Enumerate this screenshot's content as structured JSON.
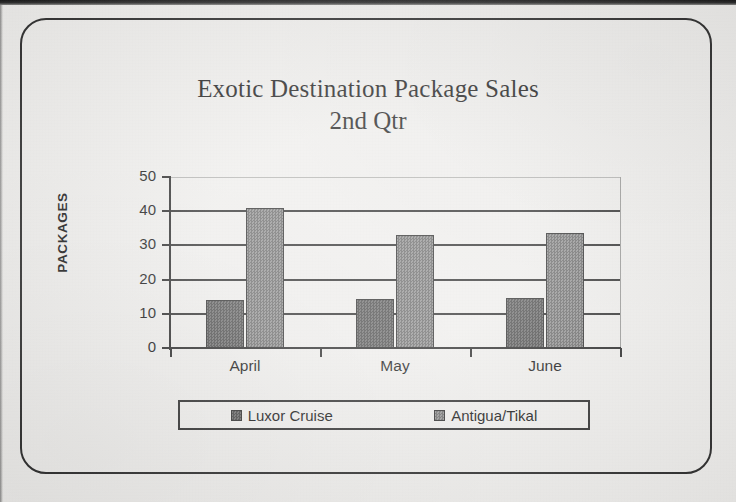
{
  "chart_data": {
    "type": "bar",
    "title": "Exotic Destination Package Sales",
    "subtitle": "2nd Qtr",
    "xlabel": "",
    "ylabel": "PACKAGES",
    "categories": [
      "April",
      "May",
      "June"
    ],
    "series": [
      {
        "name": "Luxor Cruise",
        "values": [
          14,
          14.2,
          14.5
        ],
        "color": "#5d5d5d"
      },
      {
        "name": "Antigua/Tikal",
        "values": [
          41,
          33,
          33.5
        ],
        "color": "#7c7c7c"
      }
    ],
    "ylim": [
      0,
      50
    ],
    "yticks": [
      0,
      10,
      20,
      30,
      40,
      50
    ],
    "ytick_labels": [
      "0",
      "10",
      "20",
      "30",
      "40",
      "50"
    ],
    "grid": true,
    "legend_position": "bottom"
  },
  "legend": {
    "items": [
      {
        "label": "Luxor Cruise"
      },
      {
        "label": "Antigua/Tikal"
      }
    ]
  }
}
